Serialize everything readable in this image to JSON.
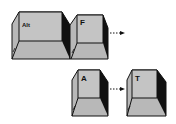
{
  "diagram": {
    "type": "keystroke-sequence",
    "rows": [
      {
        "keys": [
          {
            "label": "Alt"
          },
          {
            "label": "F"
          }
        ],
        "trailing_arrow": true
      },
      {
        "keys": [
          {
            "label": "A"
          },
          {
            "label": "T"
          }
        ],
        "arrow_between": true
      }
    ]
  },
  "colors": {
    "key_top": "#c4c4c4",
    "key_front": "#b8b8b8",
    "key_side": "#111111",
    "outline": "#111111",
    "background": "#ffffff"
  }
}
